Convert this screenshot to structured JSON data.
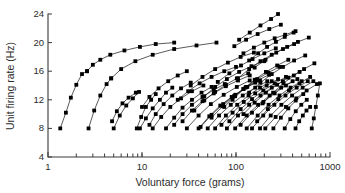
{
  "chart_data": {
    "type": "line",
    "title": "",
    "xlabel": "Voluntary force (grams)",
    "ylabel": "Unit firing rate (Hz)",
    "xscale": "log",
    "yscale": "linear",
    "xlim": [
      1,
      1000
    ],
    "ylim": [
      4,
      24
    ],
    "xticks": [
      1,
      10,
      100,
      1000
    ],
    "xticklabels": [
      "1",
      "10",
      "100",
      "1000"
    ],
    "yticks": [
      4,
      8,
      12,
      16,
      20,
      24
    ],
    "yticklabels": [
      "4",
      "8",
      "12",
      "16",
      "20",
      "24"
    ],
    "grid": false,
    "legend": null,
    "marker": "square",
    "marker_size": 1.9,
    "line_color": "#111111",
    "series_count": 50,
    "series": [
      {
        "name": "unit-1",
        "x": [
          1.35,
          1.55,
          1.75,
          2.0,
          2.3,
          2.6
        ],
        "y": [
          8.0,
          10.2,
          12.3,
          14.1,
          15.6,
          16.0
        ]
      },
      {
        "name": "unit-2",
        "x": [
          2.6,
          3.0,
          3.6,
          4.6,
          6.5,
          9.5,
          14.0,
          22.0
        ],
        "y": [
          16.0,
          16.9,
          17.6,
          18.3,
          18.9,
          19.4,
          19.8,
          20.0
        ]
      },
      {
        "name": "unit-3",
        "x": [
          2.7,
          3.1,
          3.6,
          4.2,
          4.7
        ],
        "y": [
          8.0,
          10.5,
          12.6,
          14.2,
          15.0
        ]
      },
      {
        "name": "unit-4",
        "x": [
          4.7,
          6.0,
          8.5,
          13.0,
          22.0,
          38.0,
          62.0
        ],
        "y": [
          15.0,
          16.3,
          17.4,
          18.3,
          19.1,
          19.6,
          20.0
        ]
      },
      {
        "name": "unit-5",
        "x": [
          4.8,
          5.4,
          6.2,
          7.2,
          8.6
        ],
        "y": [
          9.0,
          10.4,
          11.5,
          12.3,
          13.0
        ]
      },
      {
        "name": "unit-6",
        "x": [
          5.0,
          5.8,
          6.8,
          8.0,
          9.3
        ],
        "y": [
          8.0,
          9.8,
          11.2,
          12.2,
          13.1
        ]
      },
      {
        "name": "unit-7",
        "x": [
          8.8,
          9.8,
          11.0,
          12.5,
          14.0
        ],
        "y": [
          8.0,
          9.6,
          11.0,
          12.0,
          12.8
        ]
      },
      {
        "name": "unit-8",
        "x": [
          9.5,
          11.0,
          13.0,
          15.5,
          18.0,
          21.0
        ],
        "y": [
          8.0,
          9.4,
          10.8,
          12.0,
          13.0,
          13.7
        ]
      },
      {
        "name": "unit-9",
        "x": [
          10.0,
          12.0,
          15.0,
          19.0,
          24.0,
          30.0
        ],
        "y": [
          11.0,
          12.4,
          13.6,
          14.6,
          15.4,
          16.0
        ]
      },
      {
        "name": "unit-10",
        "x": [
          12.0,
          14.0,
          17.0,
          21.0,
          26.0,
          33.0
        ],
        "y": [
          8.5,
          10.0,
          11.4,
          12.6,
          13.6,
          14.4
        ]
      },
      {
        "name": "unit-11",
        "x": [
          13.0,
          16.0,
          20.0,
          26.0,
          34.0,
          45.0
        ],
        "y": [
          8.0,
          9.6,
          11.0,
          12.2,
          13.2,
          14.0
        ]
      },
      {
        "name": "unit-12",
        "x": [
          18.0,
          22.0,
          27.0,
          34.0,
          43.0,
          55.0
        ],
        "y": [
          8.0,
          9.5,
          10.9,
          12.0,
          13.0,
          13.8
        ]
      },
      {
        "name": "unit-13",
        "x": [
          22.0,
          27.0,
          34.0,
          44.0,
          58.0,
          76.0
        ],
        "y": [
          8.5,
          10.0,
          11.3,
          12.4,
          13.4,
          14.2
        ]
      },
      {
        "name": "unit-14",
        "x": [
          24.0,
          31.0,
          41.0,
          55.0,
          75.0,
          100.0
        ],
        "y": [
          12.0,
          13.2,
          14.3,
          15.2,
          16.0,
          16.6
        ]
      },
      {
        "name": "unit-15",
        "x": [
          27.0,
          34.0,
          44.0,
          58.0,
          78.0,
          105.0,
          140.0
        ],
        "y": [
          9.0,
          10.5,
          11.8,
          12.9,
          13.9,
          14.7,
          15.4
        ]
      },
      {
        "name": "unit-16",
        "x": [
          30.0,
          40.0,
          54.0,
          74.0,
          102.0,
          140.0
        ],
        "y": [
          8.0,
          9.8,
          11.4,
          12.7,
          13.8,
          14.7
        ]
      },
      {
        "name": "unit-17",
        "x": [
          33.0,
          44.0,
          60.0,
          82.0,
          112.0,
          155.0
        ],
        "y": [
          14.0,
          15.2,
          16.3,
          17.2,
          18.0,
          18.6
        ]
      },
      {
        "name": "unit-18",
        "x": [
          36.0,
          46.0,
          60.0,
          78.0,
          102.0,
          135.0
        ],
        "y": [
          10.5,
          11.9,
          13.1,
          14.1,
          15.0,
          15.7
        ]
      },
      {
        "name": "unit-19",
        "x": [
          40.0,
          52.0,
          68.0,
          90.0,
          120.0,
          160.0
        ],
        "y": [
          8.0,
          9.7,
          11.2,
          12.4,
          13.5,
          14.4
        ]
      },
      {
        "name": "unit-20",
        "x": [
          42.0,
          55.0,
          73.0,
          98.0,
          132.0,
          180.0
        ],
        "y": [
          8.2,
          9.9,
          11.4,
          12.7,
          13.8,
          14.7
        ]
      },
      {
        "name": "unit-21",
        "x": [
          46.0,
          60.0,
          80.0,
          108.0,
          146.0,
          200.0
        ],
        "y": [
          12.5,
          13.8,
          14.9,
          15.9,
          16.7,
          17.4
        ]
      },
      {
        "name": "unit-22",
        "x": [
          50.0,
          66.0,
          88.0,
          118.0,
          160.0,
          215.0
        ],
        "y": [
          8.0,
          9.8,
          11.3,
          12.6,
          13.7,
          14.6
        ]
      },
      {
        "name": "unit-23",
        "x": [
          55.0,
          72.0,
          95.0,
          126.0,
          168.0,
          225.0
        ],
        "y": [
          9.5,
          11.1,
          12.5,
          13.7,
          14.7,
          15.5
        ]
      },
      {
        "name": "unit-24",
        "x": [
          60.0,
          78.0,
          103.0,
          136.0,
          180.0,
          240.0
        ],
        "y": [
          8.0,
          9.8,
          11.3,
          12.6,
          13.7,
          14.6
        ]
      },
      {
        "name": "unit-25",
        "x": [
          64.0,
          85.0,
          113.0,
          150.0,
          200.0,
          265.0
        ],
        "y": [
          14.5,
          15.7,
          16.8,
          17.7,
          18.5,
          19.2
        ]
      },
      {
        "name": "unit-26",
        "x": [
          70.0,
          92.0,
          121.0,
          160.0,
          212.0,
          280.0
        ],
        "y": [
          8.5,
          10.2,
          11.7,
          12.9,
          14.0,
          14.9
        ]
      },
      {
        "name": "unit-27",
        "x": [
          75.0,
          98.0,
          128.0,
          168.0,
          220.0,
          290.0
        ],
        "y": [
          11.0,
          12.5,
          13.8,
          14.9,
          15.8,
          16.6
        ]
      },
      {
        "name": "unit-28",
        "x": [
          80.0,
          105.0,
          138.0,
          182.0,
          240.0,
          315.0
        ],
        "y": [
          8.0,
          9.8,
          11.3,
          12.6,
          13.7,
          14.6
        ]
      },
      {
        "name": "unit-29",
        "x": [
          85.0,
          112.0,
          148.0,
          195.0,
          258.0,
          340.0
        ],
        "y": [
          9.0,
          10.7,
          12.1,
          13.3,
          14.3,
          15.2
        ]
      },
      {
        "name": "unit-30",
        "x": [
          92.0,
          120.0,
          158.0,
          208.0,
          274.0,
          360.0
        ],
        "y": [
          12.0,
          13.5,
          14.8,
          15.9,
          16.8,
          17.6
        ]
      },
      {
        "name": "unit-31",
        "x": [
          98.0,
          130.0,
          172.0,
          228.0,
          302.0,
          400.0
        ],
        "y": [
          8.0,
          9.8,
          11.3,
          12.6,
          13.7,
          14.6
        ]
      },
      {
        "name": "unit-32",
        "x": [
          105.0,
          138.0,
          182.0,
          240.0,
          316.0,
          415.0
        ],
        "y": [
          15.0,
          16.3,
          17.4,
          18.3,
          19.1,
          19.8
        ]
      },
      {
        "name": "unit-33",
        "x": [
          112.0,
          148.0,
          196.0,
          258.0,
          340.0,
          450.0
        ],
        "y": [
          8.5,
          10.2,
          11.7,
          12.9,
          14.0,
          14.9
        ]
      },
      {
        "name": "unit-34",
        "x": [
          120.0,
          158.0,
          208.0,
          274.0,
          360.0,
          475.0
        ],
        "y": [
          10.0,
          11.6,
          13.0,
          14.1,
          15.1,
          15.9
        ]
      },
      {
        "name": "unit-35",
        "x": [
          130.0,
          170.0,
          222.0,
          290.0,
          380.0,
          500.0
        ],
        "y": [
          8.0,
          9.8,
          11.3,
          12.6,
          13.7,
          14.6
        ]
      },
      {
        "name": "unit-36",
        "x": [
          138.0,
          182.0,
          240.0,
          316.0,
          415.0,
          545.0
        ],
        "y": [
          13.0,
          14.4,
          15.6,
          16.6,
          17.5,
          18.2
        ]
      },
      {
        "name": "unit-37",
        "x": [
          148.0,
          195.0,
          256.0,
          336.0,
          442.0,
          580.0
        ],
        "y": [
          8.0,
          9.8,
          11.3,
          12.6,
          13.7,
          14.6
        ]
      },
      {
        "name": "unit-38",
        "x": [
          158.0,
          206.0,
          268.0,
          350.0,
          456.0,
          595.0
        ],
        "y": [
          16.5,
          17.6,
          18.6,
          19.4,
          20.1,
          20.7
        ]
      },
      {
        "name": "unit-39",
        "x": [
          168.0,
          218.0,
          282.0,
          366.0,
          474.0,
          615.0
        ],
        "y": [
          9.0,
          10.7,
          12.1,
          13.3,
          14.3,
          15.2
        ]
      },
      {
        "name": "unit-40",
        "x": [
          180.0,
          234.0,
          304.0,
          395.0,
          512.0,
          665.0
        ],
        "y": [
          8.0,
          9.8,
          11.3,
          12.6,
          13.7,
          14.6
        ]
      },
      {
        "name": "unit-41",
        "x": [
          192.0,
          248.0,
          320.0,
          412.0,
          530.0,
          682.0
        ],
        "y": [
          11.5,
          13.0,
          14.3,
          15.4,
          16.3,
          17.1
        ]
      },
      {
        "name": "unit-42",
        "x": [
          205.0,
          264.0,
          340.0,
          438.0,
          564.0,
          726.0
        ],
        "y": [
          8.0,
          9.6,
          11.0,
          12.2,
          13.3,
          14.2
        ]
      },
      {
        "name": "unit-43",
        "x": [
          138.0,
          172.0,
          214.0,
          266.0,
          330.0,
          410.0
        ],
        "y": [
          17.5,
          18.5,
          19.4,
          20.1,
          20.8,
          21.4
        ]
      },
      {
        "name": "unit-44",
        "x": [
          120.0,
          155.0,
          200.0,
          258.0,
          333.0,
          430.0
        ],
        "y": [
          18.5,
          19.3,
          20.0,
          20.6,
          21.1,
          21.6
        ]
      },
      {
        "name": "unit-45",
        "x": [
          96.0,
          128.0,
          170.0,
          226.0,
          300.0
        ],
        "y": [
          19.5,
          20.4,
          21.2,
          21.9,
          22.5
        ]
      },
      {
        "name": "unit-46",
        "x": [
          108.0,
          140.0,
          182.0,
          236.0,
          280.0
        ],
        "y": [
          20.4,
          21.4,
          22.4,
          23.3,
          24.0
        ]
      },
      {
        "name": "unit-47",
        "x": [
          250.0,
          300.0,
          360.0,
          432.0,
          520.0
        ],
        "y": [
          8.0,
          9.5,
          10.8,
          11.9,
          12.8
        ]
      },
      {
        "name": "unit-48",
        "x": [
          330.0,
          378.0,
          432.0,
          495.0,
          566.0
        ],
        "y": [
          8.0,
          9.3,
          10.4,
          11.3,
          12.0
        ]
      },
      {
        "name": "unit-49",
        "x": [
          430.0,
          470.0,
          514.0,
          562.0,
          615.0
        ],
        "y": [
          8.0,
          9.0,
          9.8,
          10.5,
          11.0
        ]
      },
      {
        "name": "unit-50",
        "x": [
          640.0,
          672.0,
          706.0,
          742.0,
          780.0
        ],
        "y": [
          8.0,
          9.4,
          11.0,
          12.6,
          14.3
        ]
      }
    ]
  }
}
